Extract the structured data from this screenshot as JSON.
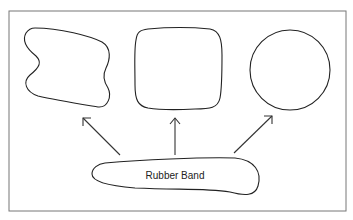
{
  "diagram": {
    "label": "Rubber Band",
    "shapes": [
      "irregular-shape",
      "rounded-square",
      "circle"
    ],
    "colors": {
      "stroke": "#222222",
      "frame": "#777777",
      "background": "#ffffff"
    }
  }
}
